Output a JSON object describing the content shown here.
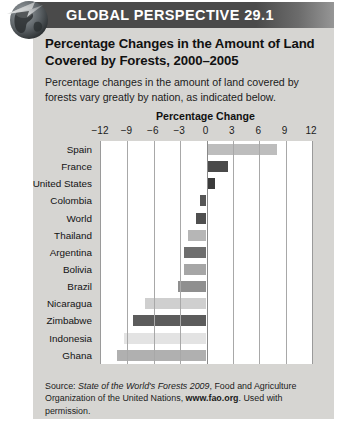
{
  "banner": {
    "title": "GLOBAL PERSPECTIVE 29.1",
    "icon": "globe-icon"
  },
  "headline": "Percentage Changes in the Amount of Land Covered by Forests, 2000–2005",
  "subtext": "Percentage changes in the amount of land covered by forests vary greatly by nation, as indicated below.",
  "source": {
    "prefix": "Source: ",
    "italic_title": "State of the World's Forests 2009",
    "middle": ", Food and Agriculture Organization of the United Nations, ",
    "bold_url": "www.fao.org",
    "suffix": ". Used with permission."
  },
  "colors": {
    "banner_bg": "#4a4a4a",
    "panel_bg": "#d6d5d2",
    "plot_bg": "#ffffff",
    "gridline": "#a8a8a8",
    "bar_dark": "#3b3b3b",
    "bar_mid": "#6e6e6e",
    "bar_light": "#a6a6a6",
    "bar_pale": "#cfcfcf",
    "bar_palest": "#e0e0e0"
  },
  "chart_data": {
    "type": "bar",
    "orientation": "horizontal",
    "title": "Percentage Change",
    "xlabel": "Percentage Change",
    "ylabel": "",
    "xlim": [
      -12,
      12
    ],
    "xticks": [
      -12,
      -9,
      -6,
      -3,
      0,
      3,
      6,
      9,
      12
    ],
    "xtick_labels": [
      "−12",
      "−9",
      "−6",
      "−3",
      "0",
      "3",
      "6",
      "9",
      "12"
    ],
    "grid": true,
    "legend": null,
    "categories": [
      "Spain",
      "France",
      "United States",
      "Colombia",
      "World",
      "Thailand",
      "Argentina",
      "Bolivia",
      "Brazil",
      "Nicaragua",
      "Zimbabwe",
      "Indonesia",
      "Ghana"
    ],
    "values": [
      8.0,
      2.5,
      1.0,
      -0.7,
      -1.2,
      -2.1,
      -2.6,
      -2.6,
      -3.2,
      -7.0,
      -8.4,
      -9.4,
      -10.2
    ],
    "bar_colors": [
      "#bdbdbd",
      "#4a4a4a",
      "#3b3b3b",
      "#565656",
      "#4f4f4f",
      "#b6b6b6",
      "#6e6e6e",
      "#a6a6a6",
      "#8f8f8f",
      "#cfcfcf",
      "#5c5c5c",
      "#e3e3e3",
      "#b0b0b0",
      "#3b3b3b"
    ]
  }
}
